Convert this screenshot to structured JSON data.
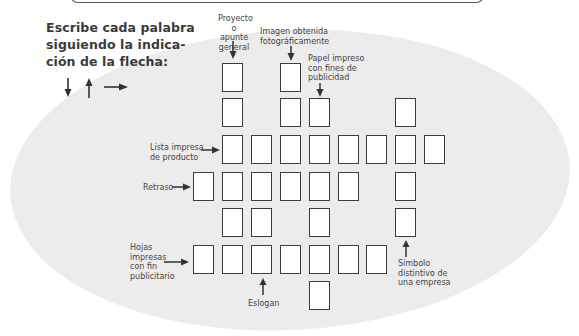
{
  "instructions": {
    "line1": "Escribe cada palabra",
    "line2": "siguiendo  la  indica-",
    "line3": "ción de la flecha:",
    "arrow_legend": [
      "arrow-down-icon",
      "arrow-up-icon",
      "arrow-right-icon"
    ]
  },
  "clues": {
    "proyecto": [
      "Proyecto",
      "o apunte",
      "general"
    ],
    "imagen": [
      "Imagen obtenida",
      "fotográficamente"
    ],
    "papel": [
      "Papel impreso",
      "con fines de",
      "publicidad"
    ],
    "lista": [
      "Lista impresa",
      "de producto"
    ],
    "retraso": [
      "Retraso"
    ],
    "hojas": [
      "Hojas",
      "impresas",
      "con fin",
      "publicitario"
    ],
    "eslogan": [
      "Eslogan"
    ],
    "simbolo": [
      "Símbolo",
      "distintivo de",
      "una empresa"
    ]
  },
  "grid": {
    "columns_x": [
      193,
      222,
      251,
      280,
      309,
      338,
      366,
      395,
      424
    ],
    "rows_y": [
      63,
      98,
      135,
      172,
      208,
      245,
      281
    ],
    "cells": [
      [
        0,
        1
      ],
      [
        0,
        3
      ],
      [
        1,
        1
      ],
      [
        1,
        3
      ],
      [
        1,
        4
      ],
      [
        1,
        7
      ],
      [
        2,
        1
      ],
      [
        2,
        2
      ],
      [
        2,
        3
      ],
      [
        2,
        4
      ],
      [
        2,
        5
      ],
      [
        2,
        6
      ],
      [
        2,
        7
      ],
      [
        2,
        8
      ],
      [
        3,
        0
      ],
      [
        3,
        1
      ],
      [
        3,
        2
      ],
      [
        3,
        3
      ],
      [
        3,
        4
      ],
      [
        3,
        5
      ],
      [
        3,
        7
      ],
      [
        4,
        1
      ],
      [
        4,
        2
      ],
      [
        4,
        4
      ],
      [
        4,
        7
      ],
      [
        5,
        0
      ],
      [
        5,
        1
      ],
      [
        5,
        2
      ],
      [
        5,
        3
      ],
      [
        5,
        4
      ],
      [
        5,
        5
      ],
      [
        5,
        6
      ],
      [
        6,
        4
      ]
    ]
  }
}
